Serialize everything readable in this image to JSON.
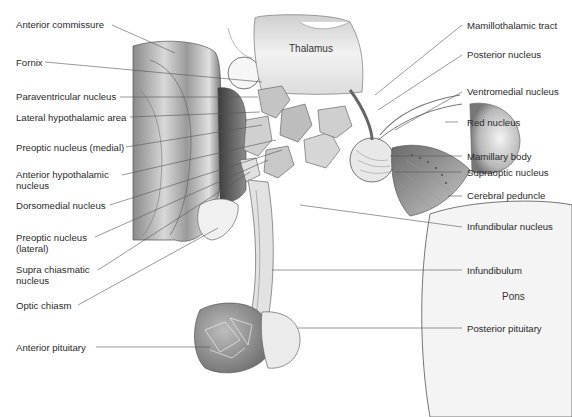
{
  "diagram": {
    "type": "anatomical-illustration",
    "inner_labels": {
      "thalamus": "Thalamus",
      "pons": "Pons"
    },
    "left_labels": [
      {
        "id": "anterior-commissure",
        "text": "Anterior commissure"
      },
      {
        "id": "fornix",
        "text": "Fornix"
      },
      {
        "id": "paraventricular-nucleus",
        "text": "Paraventricular nucleus"
      },
      {
        "id": "lateral-hypothalamic-area",
        "text": "Lateral hypothalamic area"
      },
      {
        "id": "preoptic-nucleus-medial",
        "text": "Preoptic nucleus (medial)"
      },
      {
        "id": "anterior-hypothalamic-nucleus",
        "line1": "Anterior hypothalamic",
        "line2": "nucleus"
      },
      {
        "id": "dorsomedial-nucleus",
        "text": "Dorsomedial nucleus"
      },
      {
        "id": "preoptic-nucleus-lateral",
        "line1": "Preoptic nucleus",
        "line2": "(lateral)"
      },
      {
        "id": "supra-chiasmatic-nucleus",
        "line1": "Supra chiasmatic",
        "line2": "nucleus"
      },
      {
        "id": "optic-chiasm",
        "text": "Optic chiasm"
      },
      {
        "id": "anterior-pituitary",
        "text": "Anterior pituitary"
      }
    ],
    "right_labels": [
      {
        "id": "mamillothalamic-tract",
        "text": "Mamillothalamic tract"
      },
      {
        "id": "posterior-nucleus",
        "text": "Posterior nucleus"
      },
      {
        "id": "ventromedial-nucleus",
        "text": "Ventromedial nucleus"
      },
      {
        "id": "red-nucleus",
        "text": "Red nucleus"
      },
      {
        "id": "mamillary-body",
        "text": "Mamillary body"
      },
      {
        "id": "supraoptic-nucleus",
        "text": "Supraoptic nucleus"
      },
      {
        "id": "cerebral-peduncle",
        "text": "Cerebral peduncle"
      },
      {
        "id": "infundibular-nucleus",
        "text": "Infundibular nucleus"
      },
      {
        "id": "infundibulum",
        "text": "Infundibulum"
      },
      {
        "id": "posterior-pituitary",
        "text": "Posterior pituitary"
      }
    ]
  }
}
